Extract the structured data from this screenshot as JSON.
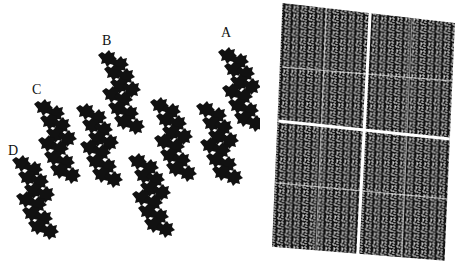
{
  "figure": {
    "left_panel": {
      "description": "Tiling of dragon-like fractal tiles",
      "labels": [
        {
          "id": "A",
          "text": "A"
        },
        {
          "id": "B",
          "text": "B"
        },
        {
          "id": "C",
          "text": "C"
        },
        {
          "id": "D",
          "text": "D"
        }
      ]
    },
    "right_panel": {
      "description": "Dense fractal texture in a slightly rotated rectangle divided into quadrants"
    },
    "colors": {
      "ink": "#111111",
      "background": "#ffffff"
    }
  }
}
